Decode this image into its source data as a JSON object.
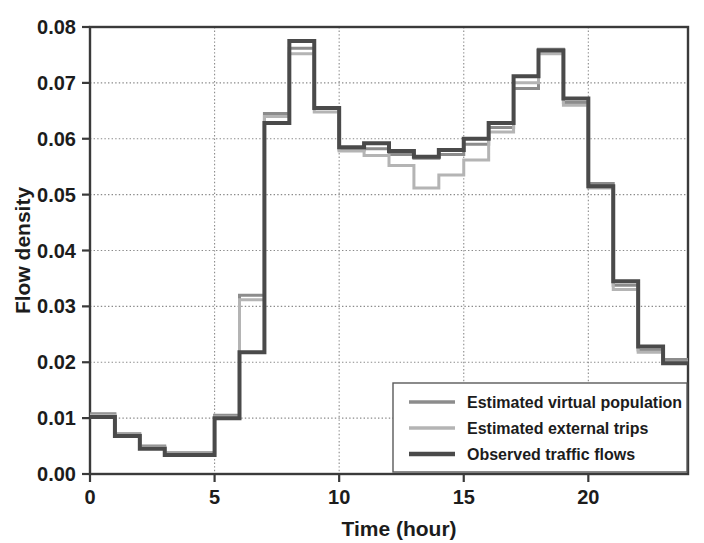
{
  "chart_data": {
    "type": "line",
    "title": "",
    "xlabel": "Time (hour)",
    "ylabel": "Flow density",
    "xlim": [
      0,
      24
    ],
    "ylim": [
      0,
      0.08
    ],
    "xticks": [
      0,
      5,
      10,
      15,
      20
    ],
    "xtick_labels": [
      "0",
      "5",
      "10",
      "15",
      "20"
    ],
    "yticks": [
      0.0,
      0.01,
      0.02,
      0.03,
      0.04,
      0.05,
      0.06,
      0.07,
      0.08
    ],
    "ytick_labels": [
      "0.00",
      "0.01",
      "0.02",
      "0.03",
      "0.04",
      "0.05",
      "0.06",
      "0.07",
      "0.08"
    ],
    "grid": true,
    "grid_style": "dotted",
    "legend_position": "lower-right",
    "drawstyle": "steps",
    "x": [
      0.5,
      1.5,
      2.5,
      3.5,
      4.5,
      5.5,
      6.5,
      7.5,
      8.5,
      9.5,
      10.5,
      11.5,
      12.5,
      13.5,
      14.5,
      15.5,
      16.5,
      17.5,
      18.5,
      19.5,
      20.5,
      21.5,
      22.5,
      23.5
    ],
    "series": [
      {
        "name": "Estimated virtual population",
        "color": "#8c8c8c",
        "width": 3.0,
        "values": [
          0.0108,
          0.0072,
          0.005,
          0.0038,
          0.0038,
          0.0105,
          0.032,
          0.0645,
          0.0762,
          0.0655,
          0.058,
          0.0582,
          0.0572,
          0.0565,
          0.0572,
          0.059,
          0.062,
          0.069,
          0.076,
          0.0665,
          0.052,
          0.0338,
          0.0222,
          0.0205
        ]
      },
      {
        "name": "Estimated external trips",
        "color": "#b4b4b4",
        "width": 3.0,
        "values": [
          0.0105,
          0.007,
          0.0048,
          0.0036,
          0.0036,
          0.0102,
          0.0312,
          0.064,
          0.0752,
          0.0648,
          0.0578,
          0.057,
          0.0552,
          0.0512,
          0.0535,
          0.0562,
          0.0612,
          0.07,
          0.0752,
          0.066,
          0.0512,
          0.033,
          0.0218,
          0.02
        ]
      },
      {
        "name": "Observed traffic flows",
        "color": "#4a4a4a",
        "width": 4.0,
        "values": [
          0.0102,
          0.0068,
          0.0045,
          0.0034,
          0.0034,
          0.01,
          0.0218,
          0.0628,
          0.0775,
          0.0655,
          0.0585,
          0.0592,
          0.0578,
          0.0568,
          0.058,
          0.06,
          0.0628,
          0.0712,
          0.0758,
          0.0672,
          0.0515,
          0.0345,
          0.0228,
          0.0198
        ]
      }
    ]
  },
  "legend": {
    "entries": [
      {
        "label": "Estimated virtual population"
      },
      {
        "label": "Estimated external trips"
      },
      {
        "label": "Observed traffic flows"
      }
    ]
  },
  "axes": {
    "x_title": "Time (hour)",
    "y_title": "Flow density"
  }
}
